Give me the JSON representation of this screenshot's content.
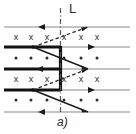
{
  "figure": {
    "caption": "a)",
    "boundary_label": "L",
    "cross_glyph": "x",
    "dot_glyph": "•",
    "colors": {
      "line_thin": "#8a8a8a",
      "line_thick": "#1a1a1a",
      "marker": "#2b2b2b",
      "dashdot": "#555555",
      "background": "#ffffff"
    }
  },
  "diagram_data": {
    "type": "physics-field-diagram",
    "description": "Alternating rows of magnetic field into-page (x) and out-of-page (dot) markers crossed by horizontal conductor lines, a vertical dash-dot boundary line labelled L, and solid/dashed diagonal ray paths.",
    "boundary_line": {
      "x": 60,
      "y_top": 8,
      "y_bottom": 112,
      "style": "dash-dot",
      "label": "L"
    },
    "vertical_thick_segment": {
      "x": 60,
      "y_top": 47,
      "y_bottom": 90
    },
    "horizontal_lines": [
      {
        "y": 27,
        "thick_from": null,
        "thick_to": null,
        "arrow": "left",
        "arrow_x": 41
      },
      {
        "y": 47,
        "thick_from": 4,
        "thick_to": 60,
        "arrow": "right",
        "arrow_x": 92
      },
      {
        "y": 69,
        "thick_from": 4,
        "thick_to": 60,
        "arrow": "left",
        "arrow_x": 40
      },
      {
        "y": 90,
        "thick_from": 4,
        "thick_to": 60,
        "arrow": "right",
        "arrow_x": 92
      },
      {
        "y": 112,
        "thick_from": null,
        "thick_to": null,
        "arrow": "left",
        "arrow_x": 41
      }
    ],
    "marker_rows": [
      {
        "y": 37,
        "glyph": "x",
        "xs": [
          16,
          31,
          47,
          63,
          80,
          96
        ]
      },
      {
        "y": 58,
        "glyph": "dot",
        "xs": [
          16,
          31,
          47,
          63,
          80,
          96
        ]
      },
      {
        "y": 79,
        "glyph": "x",
        "xs": [
          16,
          31,
          47,
          63,
          80,
          96
        ]
      },
      {
        "y": 100,
        "glyph": "dot",
        "xs": [
          16,
          31,
          47,
          63,
          80,
          96
        ]
      }
    ],
    "solid_rays": [
      {
        "from": [
          33,
          47
        ],
        "to": [
          88,
          69
        ],
        "arrow_at_end": true
      },
      {
        "from": [
          33,
          90
        ],
        "to": [
          88,
          112
        ],
        "arrow_at_end": true
      }
    ],
    "dashed_rays": [
      {
        "from": [
          33,
          47
        ],
        "to": [
          88,
          27
        ],
        "arrow_at_end": true
      },
      {
        "from": [
          33,
          90
        ],
        "to": [
          88,
          69
        ],
        "arrow_at_end": true
      }
    ]
  }
}
